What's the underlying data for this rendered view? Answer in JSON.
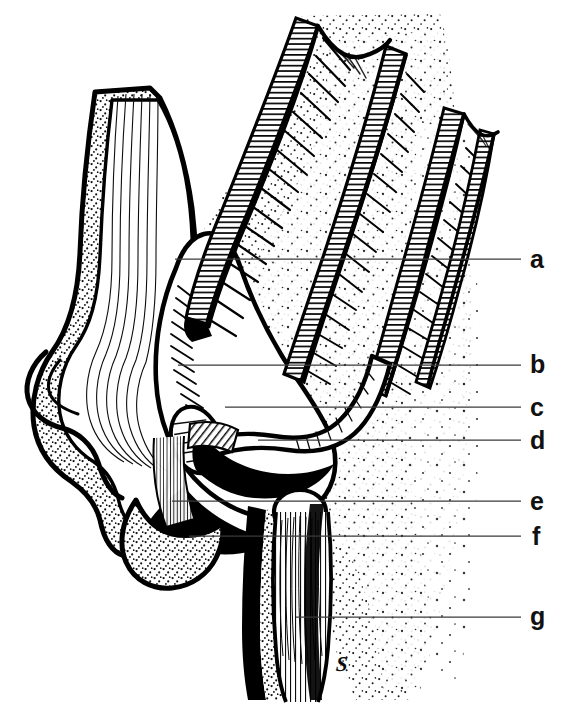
{
  "figure": {
    "kind": "scientific-line-drawing",
    "medium": "pen-and-ink stipple",
    "background_color": "#ffffff",
    "ink_color": "#000000",
    "leader_line_color": "#3a3a3a",
    "width": 568,
    "height": 712,
    "caption": "",
    "title": "",
    "signature": {
      "name": "artist-monogram",
      "glyph": "S",
      "x": 336,
      "y": 662
    }
  },
  "labels": [
    {
      "key": "a",
      "text": "a",
      "label_x": 530,
      "label_y": 247,
      "line_y": 259,
      "line_x_start": 175,
      "line_x_end": 521
    },
    {
      "key": "b",
      "text": "b",
      "label_x": 530,
      "label_y": 352,
      "line_y": 365,
      "line_x_start": 178,
      "line_x_end": 521
    },
    {
      "key": "c",
      "text": "c",
      "label_x": 530,
      "label_y": 395,
      "line_y": 407,
      "line_x_start": 225,
      "line_x_end": 521
    },
    {
      "key": "d",
      "text": "d",
      "label_x": 530,
      "label_y": 428,
      "line_y": 440,
      "line_x_start": 258,
      "line_x_end": 521
    },
    {
      "key": "e",
      "text": "e",
      "label_x": 530,
      "label_y": 489,
      "line_y": 501,
      "line_x_start": 172,
      "line_x_end": 521
    },
    {
      "key": "f",
      "text": "f",
      "label_x": 532,
      "label_y": 524,
      "line_y": 536,
      "line_x_start": 189,
      "line_x_end": 521
    },
    {
      "key": "g",
      "text": "g",
      "label_x": 530,
      "label_y": 604,
      "line_y": 617,
      "line_x_start": 296,
      "line_x_end": 521
    }
  ],
  "colors": {
    "ink": "#000000",
    "paper": "#ffffff",
    "leader": "#3a3a3a",
    "stipple": "#141414"
  }
}
